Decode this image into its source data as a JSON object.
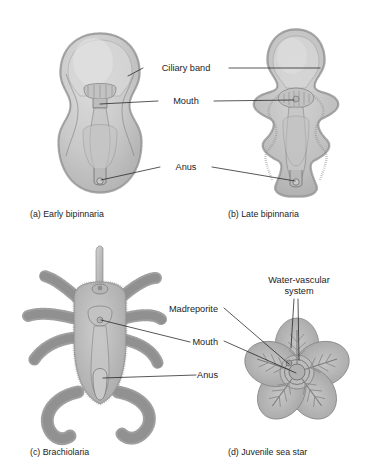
{
  "figure": {
    "background_color": "#ffffff",
    "ink_color": "#1d1d1d",
    "palette": {
      "body_light": "#d2d2d2",
      "body_mid": "#bdbdbd",
      "body_dark": "#a8a8a8",
      "outline": "#8e8e8e",
      "cilia": "#9a9a9a",
      "leader": "#202020"
    }
  },
  "panels": [
    {
      "id": "a",
      "caption": "(a) Early bipinnaria",
      "caption_x": 30,
      "caption_y": 217,
      "organism": "early-bipinnaria-larva"
    },
    {
      "id": "b",
      "caption": "(b) Late bipinnaria",
      "caption_x": 228,
      "caption_y": 217,
      "organism": "late-bipinnaria-larva"
    },
    {
      "id": "c",
      "caption": "(c) Brachiolaria",
      "caption_x": 30,
      "caption_y": 455,
      "organism": "brachiolaria-larva"
    },
    {
      "id": "d",
      "caption": "(d) Juvenile sea star",
      "caption_x": 228,
      "caption_y": 455,
      "organism": "juvenile-sea-star"
    }
  ],
  "labels": {
    "ciliary_band": {
      "text": "Ciliary band",
      "x": 186,
      "y": 71,
      "anchor": "middle"
    },
    "mouth_top": {
      "text": "Mouth",
      "x": 186,
      "y": 104,
      "anchor": "middle"
    },
    "anus_top": {
      "text": "Anus",
      "x": 186,
      "y": 170,
      "anchor": "middle"
    },
    "madreporite": {
      "text": "Madreporite",
      "x": 218,
      "y": 312,
      "anchor": "end"
    },
    "mouth_bottom": {
      "text": "Mouth",
      "x": 218,
      "y": 345,
      "anchor": "end"
    },
    "anus_bottom": {
      "text": "Anus",
      "x": 218,
      "y": 378,
      "anchor": "end"
    },
    "water_vascular_line1": {
      "text": "Water-vascular",
      "x": 299,
      "y": 283,
      "anchor": "middle"
    },
    "water_vascular_line2": {
      "text": "system",
      "x": 299,
      "y": 294,
      "anchor": "middle"
    }
  }
}
